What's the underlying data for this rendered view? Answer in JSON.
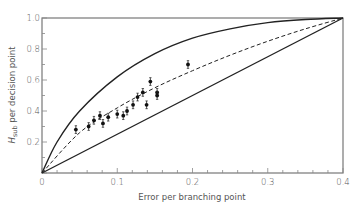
{
  "chart_data": {
    "type": "scatter",
    "title": "",
    "xlabel": "Error per branching point",
    "ylabel": "H_sub per decision point",
    "ylabel_main": "H",
    "ylabel_sub": "sub",
    "ylabel_rest": " per decision point",
    "xlim": [
      0,
      0.4
    ],
    "ylim": [
      0,
      1.0
    ],
    "grid": false,
    "legend": null,
    "x_ticks": [
      0,
      0.1,
      0.2,
      0.3,
      0.4
    ],
    "x_tick_labels": [
      "0",
      "0.1",
      "0.2",
      "0.3",
      "0.4"
    ],
    "y_ticks": [
      0,
      0.2,
      0.4,
      0.6,
      0.8,
      1.0
    ],
    "y_tick_labels": [
      "0",
      "0.2",
      "0.4",
      "0.6",
      "0.8",
      "1.0"
    ],
    "series": [
      {
        "name": "Upper bound (solid curve)",
        "style": "solid",
        "kind": "line",
        "x": [
          0,
          0.02,
          0.05,
          0.1,
          0.15,
          0.2,
          0.25,
          0.3,
          0.35,
          0.4
        ],
        "values": [
          0,
          0.2,
          0.4,
          0.62,
          0.77,
          0.87,
          0.93,
          0.97,
          0.99,
          1.0
        ]
      },
      {
        "name": "Lower bound (solid straight line)",
        "style": "solid",
        "kind": "line",
        "x": [
          0,
          0.4
        ],
        "values": [
          0,
          1.0
        ]
      },
      {
        "name": "Fitted curve (dashed)",
        "style": "dashed",
        "kind": "line",
        "x": [
          0,
          0.05,
          0.1,
          0.15,
          0.2,
          0.25,
          0.3,
          0.35,
          0.4
        ],
        "values": [
          0,
          0.26,
          0.42,
          0.55,
          0.66,
          0.76,
          0.85,
          0.93,
          1.0
        ]
      },
      {
        "name": "Observed data (with error bars)",
        "kind": "scatter",
        "x": [
          0.045,
          0.062,
          0.069,
          0.077,
          0.081,
          0.088,
          0.1,
          0.108,
          0.113,
          0.121,
          0.127,
          0.134,
          0.139,
          0.144,
          0.153,
          0.153,
          0.194
        ],
        "values": [
          0.28,
          0.3,
          0.34,
          0.37,
          0.32,
          0.36,
          0.38,
          0.37,
          0.4,
          0.44,
          0.49,
          0.52,
          0.44,
          0.59,
          0.52,
          0.5,
          0.7
        ],
        "error": 0.025
      }
    ]
  }
}
